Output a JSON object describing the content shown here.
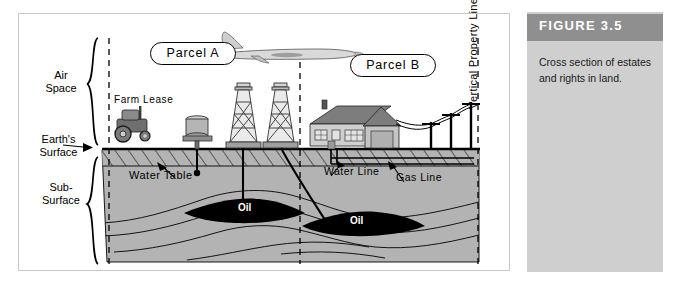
{
  "figure": {
    "header_label": "FIGURE 3.5",
    "caption": "Cross section of estates and rights in land.",
    "header_color": "#8f8f8f",
    "panel_color": "#cfcfcf"
  },
  "diagram": {
    "title": "Cross section of estates and rights in land",
    "zone_labels": {
      "air_space": "Air\nSpace",
      "air_space_line1": "Air",
      "air_space_line2": "Space",
      "earths_surface_line1": "Earth's",
      "earths_surface_line2": "Surface",
      "sub_surface_line1": "Sub-",
      "sub_surface_line2": "Surface"
    },
    "parcels": [
      {
        "label": "Parcel  A"
      },
      {
        "label": "Parcel  B"
      }
    ],
    "annotations": [
      {
        "name": "farm-lease",
        "label": "Farm  Lease"
      },
      {
        "name": "water-table",
        "label": "Water  Table"
      },
      {
        "name": "water-line",
        "label": "Water  Line"
      },
      {
        "name": "gas-line",
        "label": "Gas  Line"
      },
      {
        "name": "oil-deposit-a",
        "label": "Oil"
      },
      {
        "name": "oil-deposit-b",
        "label": "Oil"
      },
      {
        "name": "vertical-property-lines",
        "label": "Vertical  Property  Lines"
      }
    ],
    "colors": {
      "subsurface_fill": "#b3b3b3",
      "oil_fill": "#000000",
      "outline": "#000000",
      "frame_border": "#c9c9c9"
    }
  }
}
